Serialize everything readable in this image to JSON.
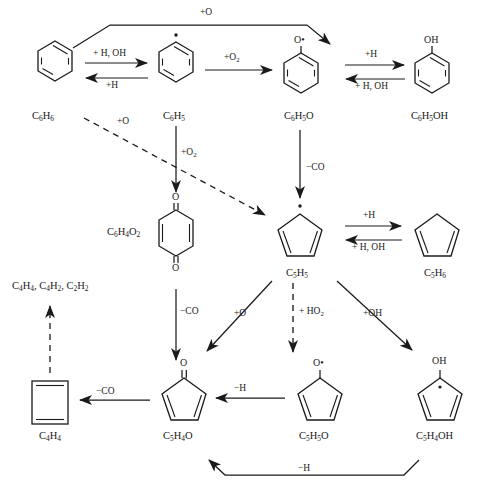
{
  "diagram": {
    "type": "chemical-mechanism",
    "species": [
      {
        "id": "c6h6",
        "formula_html": "C<sub>6</sub>H<sub>6</sub>",
        "label": "C6H6",
        "structure": "benzene",
        "x": 32,
        "y": 111
      },
      {
        "id": "c6h5",
        "formula_html": "C<sub>6</sub>H<sub>5</sub>",
        "label": "C6H5",
        "structure": "phenyl-radical",
        "x": 163,
        "y": 111
      },
      {
        "id": "c6h5o",
        "formula_html": "C<sub>6</sub>H<sub>5</sub>O",
        "label": "C6H5O",
        "structure": "phenoxy-radical",
        "x": 287,
        "y": 111
      },
      {
        "id": "c6h5oh",
        "formula_html": "C<sub>6</sub>H<sub>5</sub>OH",
        "label": "C6H5OH",
        "structure": "phenol",
        "x": 418,
        "y": 111
      },
      {
        "id": "c6h4o2",
        "formula_html": "C<sub>6</sub>H<sub>4</sub>O<sub>2</sub>",
        "label": "C6H4O2",
        "structure": "benzoquinone",
        "x": 110,
        "y": 232
      },
      {
        "id": "c5h5",
        "formula_html": "C<sub>5</sub>H<sub>5</sub>",
        "label": "C5H5",
        "structure": "cyclopentadienyl-radical",
        "x": 286,
        "y": 270
      },
      {
        "id": "c5h6",
        "formula_html": "C<sub>5</sub>H<sub>6</sub>",
        "label": "C5H6",
        "structure": "cyclopentadiene",
        "x": 424,
        "y": 270
      },
      {
        "id": "c4h4",
        "formula_html": "C<sub>4</sub>H<sub>4</sub>",
        "label": "C4H4",
        "structure": "cyclobutadiene",
        "x": 43,
        "y": 436
      },
      {
        "id": "c5h4o",
        "formula_html": "C<sub>5</sub>H<sub>4</sub>O",
        "label": "C5H4O",
        "structure": "cyclopentadienone",
        "x": 164,
        "y": 440
      },
      {
        "id": "c5h5o",
        "formula_html": "C<sub>5</sub>H<sub>5</sub>O",
        "label": "C5H5O",
        "structure": "cyclopentadienoxy",
        "x": 302,
        "y": 440
      },
      {
        "id": "c5h4oh",
        "formula_html": "C<sub>5</sub>H<sub>4</sub>OH",
        "label": "C5H4OH",
        "structure": "hydroxycyclopentadienyl",
        "x": 420,
        "y": 440
      },
      {
        "id": "products",
        "formula_html": "C<sub>4</sub>H<sub>4</sub>, C<sub>4</sub>H<sub>2</sub>, C<sub>2</sub>H<sub>2</sub>",
        "label": "C4H4, C4H2, C2H2",
        "structure": "text-only",
        "x": 14,
        "y": 288
      }
    ],
    "atom_labels": [
      {
        "id": "c6h5o-O",
        "text": "O•",
        "x": 280,
        "y": 38
      },
      {
        "id": "c6h5oh-OH",
        "text": "OH",
        "x": 411,
        "y": 38
      },
      {
        "id": "quinone-O-top",
        "text": "O",
        "x": 172,
        "y": 196
      },
      {
        "id": "quinone-O-bottom",
        "text": "O",
        "x": 172,
        "y": 265
      },
      {
        "id": "c5h4o-O",
        "text": "O",
        "x": 180,
        "y": 360
      },
      {
        "id": "c5h5o-O",
        "text": "O•",
        "x": 313,
        "y": 360
      },
      {
        "id": "c5h4oh-OH",
        "text": "OH",
        "x": 437,
        "y": 358
      }
    ],
    "reactions": [
      {
        "id": "r-top-o",
        "label_html": "+O",
        "label": "+O",
        "kind": "solid",
        "from": "c6h6",
        "to": "c6h5o",
        "lx": 218,
        "ly": 11
      },
      {
        "id": "r-h-oh-fwd",
        "label_html": "+ H, OH",
        "label": "+ H, OH",
        "kind": "solid",
        "from": "c6h6",
        "to": "c6h5",
        "lx": 102,
        "ly": 52
      },
      {
        "id": "r-h-rev1",
        "label_html": "+H",
        "label": "+H",
        "kind": "solid",
        "from": "c6h5",
        "to": "c6h6",
        "lx": 111,
        "ly": 85
      },
      {
        "id": "r-o2-1",
        "label_html": "+O<sub>2</sub>",
        "label": "+O2",
        "kind": "solid",
        "from": "c6h5",
        "to": "c6h5o",
        "lx": 229,
        "ly": 56
      },
      {
        "id": "r-h-fwd2",
        "label_html": "+H",
        "label": "+H",
        "kind": "solid",
        "from": "c6h5o",
        "to": "c6h5oh",
        "lx": 370,
        "ly": 54
      },
      {
        "id": "r-h-oh-rev2",
        "label_html": "+ H, OH",
        "label": "+ H, OH",
        "kind": "solid",
        "from": "c6h5oh",
        "to": "c6h5o",
        "lx": 362,
        "ly": 85
      },
      {
        "id": "r-o-dashed",
        "label_html": "+O",
        "label": "+O",
        "kind": "dashed",
        "from": "c6h6",
        "to": "c5h5",
        "lx": 126,
        "ly": 123
      },
      {
        "id": "r-o2-2",
        "label_html": "+O<sub>2</sub>",
        "label": "+O2",
        "kind": "solid",
        "from": "c6h5",
        "to": "c6h4o2",
        "lx": 184,
        "ly": 152
      },
      {
        "id": "r-co-1",
        "label_html": "−CO",
        "label": "-CO",
        "kind": "solid",
        "from": "c6h5o",
        "to": "c5h5",
        "lx": 347,
        "ly": 167
      },
      {
        "id": "r-h-fwd3",
        "label_html": "+H",
        "label": "+H",
        "kind": "solid",
        "from": "c5h5",
        "to": "c5h6",
        "lx": 379,
        "ly": 215
      },
      {
        "id": "r-h-oh-rev3",
        "label_html": "+ H, OH",
        "label": "+ H, OH",
        "kind": "solid",
        "from": "c5h6",
        "to": "c5h5",
        "lx": 365,
        "ly": 245
      },
      {
        "id": "r-co-2",
        "label_html": "−CO",
        "label": "-CO",
        "kind": "solid",
        "from": "c5h5",
        "to": "c5h4o",
        "lx": 186,
        "ly": 311
      },
      {
        "id": "r-o-diag",
        "label_html": "+O",
        "label": "+O",
        "kind": "solid",
        "from": "c5h5",
        "to": "c5h4o",
        "lx": 242,
        "ly": 313
      },
      {
        "id": "r-ho2",
        "label_html": "+ HO<sub>2</sub>",
        "label": "+HO2",
        "kind": "dashed",
        "from": "c5h5",
        "to": "c5h5o",
        "lx": 305,
        "ly": 311
      },
      {
        "id": "r-oh-diag",
        "label_html": "+OH",
        "label": "+OH",
        "kind": "solid",
        "from": "c5h5",
        "to": "c5h4oh",
        "lx": 370,
        "ly": 313
      },
      {
        "id": "r-co-3",
        "label_html": "−CO",
        "label": "-CO",
        "kind": "solid",
        "from": "c5h4o",
        "to": "c4h4",
        "lx": 99,
        "ly": 388
      },
      {
        "id": "r-h-minus",
        "label_html": "−H",
        "label": "-H",
        "kind": "solid",
        "from": "c5h5o",
        "to": "c5h4o",
        "lx": 238,
        "ly": 385
      },
      {
        "id": "r-h-bottom",
        "label_html": "−H",
        "label": "−H",
        "kind": "solid",
        "from": "c5h4oh",
        "to": "c5h4o",
        "lx": 304,
        "ly": 466
      },
      {
        "id": "r-frag-dashed",
        "label_html": "",
        "label": "",
        "kind": "dashed",
        "from": "c4h4",
        "to": "products",
        "lx": 0,
        "ly": 0
      }
    ],
    "colors": {
      "stroke": "#1a1a1a",
      "background": "#ffffff",
      "text": "#1a1a1a"
    }
  }
}
